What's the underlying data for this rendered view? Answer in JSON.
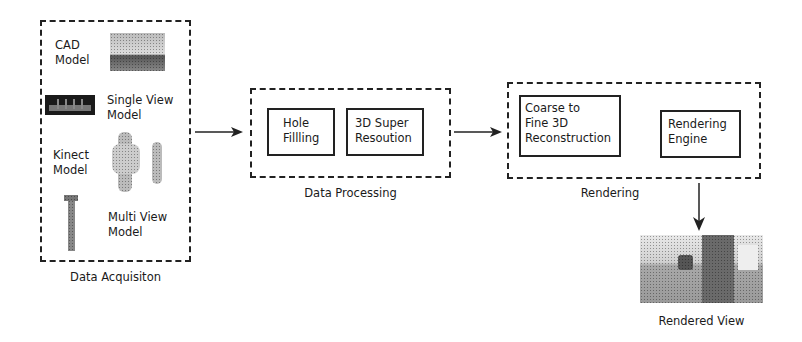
{
  "stages": {
    "acquisition": {
      "title": "Data Acquisiton",
      "items": [
        {
          "label_line1": "CAD",
          "label_line2": "Model",
          "thumbnail": "cad-model-image"
        },
        {
          "label_line1": "Single View",
          "label_line2": "Model",
          "thumbnail": "single-view-model-image"
        },
        {
          "label_line1": "Kinect",
          "label_line2": "Model",
          "thumbnail": "kinect-model-image"
        },
        {
          "label_line1": "Multi View",
          "label_line2": "Model",
          "thumbnail": "multi-view-model-image"
        }
      ]
    },
    "processing": {
      "title": "Data Processing",
      "blocks": [
        {
          "line1": "Hole",
          "line2": "Fillling"
        },
        {
          "line1": "3D Super",
          "line2": "Resoution"
        }
      ]
    },
    "rendering": {
      "title": "Rendering",
      "blocks": [
        {
          "line1": "Coarse to",
          "line2": "Fine 3D",
          "line3": "Reconstruction"
        },
        {
          "line1": "Rendering",
          "line2": "Engine"
        }
      ]
    },
    "output": {
      "title": "Rendered View",
      "thumbnail": "rendered-view-image"
    }
  },
  "colors": {
    "stroke": "#222222",
    "background": "#ffffff"
  }
}
